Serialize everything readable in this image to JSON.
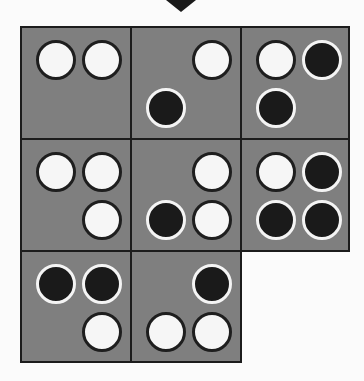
{
  "board": {
    "colors": {
      "background": "#fbfbfb",
      "cell_fill": "#7f7f7f",
      "cell_border": "#1c1c1c",
      "white_stone": "#f6f6f6",
      "black_stone": "#1a1a1a",
      "arrow": "#1a1a1a"
    },
    "indicator": {
      "icon": "arrow-down-icon"
    },
    "slot_order": [
      "top-left",
      "top-right",
      "bottom-left",
      "bottom-right"
    ],
    "cells": [
      {
        "row": 0,
        "col": 0,
        "slots": [
          "white",
          "white",
          null,
          null
        ]
      },
      {
        "row": 0,
        "col": 1,
        "slots": [
          null,
          "white",
          "black",
          null
        ]
      },
      {
        "row": 0,
        "col": 2,
        "slots": [
          "white",
          "black",
          "black",
          null
        ]
      },
      {
        "row": 1,
        "col": 0,
        "slots": [
          "white",
          "white",
          null,
          "white"
        ]
      },
      {
        "row": 1,
        "col": 1,
        "slots": [
          null,
          "white",
          "black",
          "white"
        ]
      },
      {
        "row": 1,
        "col": 2,
        "slots": [
          "white",
          "black",
          "black",
          "black"
        ]
      },
      {
        "row": 2,
        "col": 0,
        "slots": [
          "black",
          "black",
          null,
          "white"
        ]
      },
      {
        "row": 2,
        "col": 1,
        "slots": [
          null,
          "black",
          "white",
          "white"
        ]
      }
    ]
  }
}
